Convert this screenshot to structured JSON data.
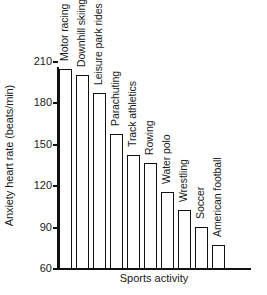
{
  "chart_data": {
    "type": "bar",
    "title": "",
    "xlabel": "Sports activity",
    "ylabel": "Anxiety heart rate (beats/min)",
    "ylim": [
      60,
      210
    ],
    "yticks": [
      60,
      90,
      120,
      150,
      180,
      210
    ],
    "grid": false,
    "legend": null,
    "orientation": "vertical",
    "bar_style": "outlined-white",
    "categories": [
      "Motor racing",
      "Downhill skiing",
      "Leisure park rides",
      "Parachuting",
      "Track athletics",
      "Rowing",
      "Water polo",
      "Wrestling",
      "Soccer",
      "American football"
    ],
    "values": [
      204,
      200,
      187,
      157,
      142,
      136,
      115,
      102,
      90,
      77
    ],
    "units": "beats/min"
  },
  "colors": {
    "background": "#ffffff",
    "axis": "#111111",
    "text": "#1a1a1a",
    "bar_fill": "#ffffff",
    "bar_stroke": "#111111"
  }
}
